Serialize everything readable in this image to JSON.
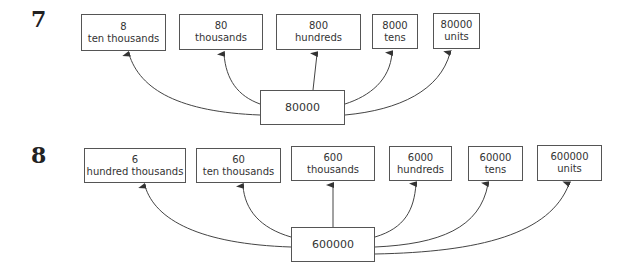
{
  "diagrams": [
    {
      "number": "7",
      "center": "80000",
      "boxes": [
        {
          "value": "8",
          "place": "ten thousands"
        },
        {
          "value": "80",
          "place": "thousands"
        },
        {
          "value": "800",
          "place": "hundreds"
        },
        {
          "value": "8000",
          "place": "tens"
        },
        {
          "value": "80000",
          "place": "units"
        }
      ]
    },
    {
      "number": "8",
      "center": "600000",
      "boxes": [
        {
          "value": "6",
          "place": "hundred thousands"
        },
        {
          "value": "60",
          "place": "ten thousands"
        },
        {
          "value": "600",
          "place": "thousands"
        },
        {
          "value": "6000",
          "place": "hundreds"
        },
        {
          "value": "60000",
          "place": "tens"
        },
        {
          "value": "600000",
          "place": "units"
        }
      ]
    }
  ]
}
